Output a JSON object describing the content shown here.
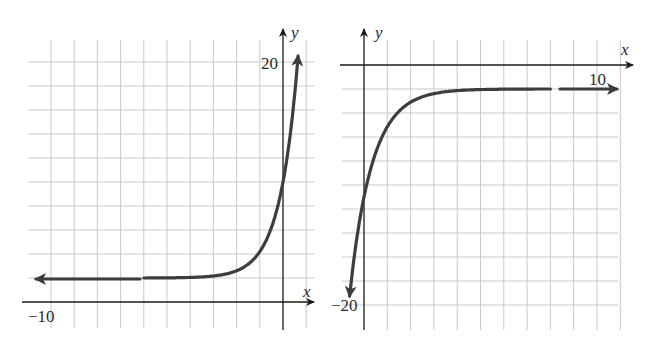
{
  "chart_data": [
    {
      "type": "line",
      "title": "",
      "xlabel": "x",
      "ylabel": "y",
      "tick_labels": {
        "x": [
          "-10"
        ],
        "y": [
          "20"
        ]
      },
      "xlim": [
        -10.5,
        1
      ],
      "ylim": [
        -1,
        23
      ],
      "x_unit_per_grid": 1,
      "y_unit_per_grid": 2,
      "grid": true,
      "description": "Exponential growth curve with horizontal asymptote y = 2, rising steeply through the y-axis near y = 10",
      "asymptote_y": 2,
      "series": [
        {
          "name": "curve",
          "x": [
            -10,
            -6,
            -4,
            -3,
            -2,
            -1,
            0,
            0.5,
            0.7
          ],
          "y": [
            2,
            2,
            2.05,
            2.2,
            2.6,
            4.2,
            10,
            17,
            21.5
          ]
        }
      ]
    },
    {
      "type": "line",
      "title": "",
      "xlabel": "x",
      "ylabel": "y",
      "tick_labels": {
        "x": [
          "10"
        ],
        "y": [
          "-20"
        ]
      },
      "xlim": [
        -1,
        11.5
      ],
      "ylim": [
        -22,
        1
      ],
      "x_unit_per_grid": 1,
      "y_unit_per_grid": 2,
      "grid": true,
      "description": "Exponential decay-type curve rising from below to a horizontal asymptote y = -2, crossing the y-axis near y = -11",
      "asymptote_y": -2,
      "series": [
        {
          "name": "curve",
          "x": [
            -0.65,
            -0.3,
            0,
            1,
            2,
            3,
            4,
            6,
            8,
            10.7
          ],
          "y": [
            -19,
            -14,
            -11,
            -5.1,
            -3.1,
            -2.4,
            -2.1,
            -2,
            -2,
            -2
          ]
        }
      ]
    }
  ],
  "left": {
    "x_label": "x",
    "y_label": "y",
    "tick_x": "−10",
    "tick_y": "20"
  },
  "right": {
    "x_label": "x",
    "y_label": "y",
    "tick_x": "10",
    "tick_y": "−20"
  },
  "colors": {
    "curve": "#3d3d3d",
    "axis": "#1a1a1a",
    "grid": "#c9c9c9"
  }
}
